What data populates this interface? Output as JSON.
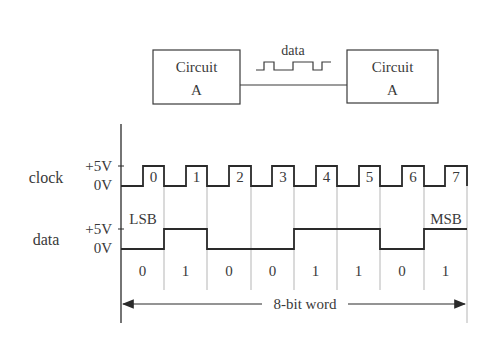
{
  "top_diagram": {
    "left_box": {
      "line1": "Circuit",
      "line2": "A"
    },
    "right_box": {
      "line1": "Circuit",
      "line2": "A"
    },
    "link_label": "data"
  },
  "timing": {
    "clock_label": "clock",
    "data_label": "data",
    "high_level": "+5V",
    "low_level": "0V",
    "clock_pulse_labels": [
      "0",
      "1",
      "2",
      "3",
      "4",
      "5",
      "6",
      "7"
    ],
    "lsb_label": "LSB",
    "msb_label": "MSB",
    "bits": [
      "0",
      "1",
      "0",
      "0",
      "1",
      "1",
      "0",
      "1"
    ],
    "word_label": "8-bit word"
  },
  "colors": {
    "line": "#2a2a2a",
    "grid": "#b5b5b5",
    "text": "#3a3a3a",
    "background": "#ffffff"
  }
}
